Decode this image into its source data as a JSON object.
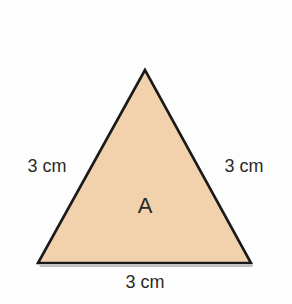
{
  "diagram": {
    "shape": "equilateral-triangle",
    "fill_color": "#f2d2ad",
    "stroke_color": "#1a1a1a",
    "center_label": "A",
    "side_labels": {
      "left": "3 cm",
      "right": "3 cm",
      "bottom": "3 cm"
    }
  }
}
